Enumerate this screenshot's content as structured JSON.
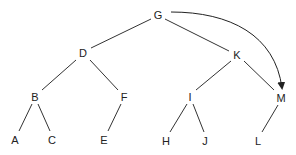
{
  "diagram": {
    "type": "tree",
    "line_color": "#333333",
    "nodes": [
      {
        "id": "G",
        "label": "G",
        "x": 158,
        "y": 15
      },
      {
        "id": "D",
        "label": "D",
        "x": 83,
        "y": 53
      },
      {
        "id": "K",
        "label": "K",
        "x": 237,
        "y": 55
      },
      {
        "id": "B",
        "label": "B",
        "x": 35,
        "y": 97
      },
      {
        "id": "F",
        "label": "F",
        "x": 124,
        "y": 97
      },
      {
        "id": "I",
        "label": "I",
        "x": 190,
        "y": 97
      },
      {
        "id": "M",
        "label": "M",
        "x": 281,
        "y": 98
      },
      {
        "id": "A",
        "label": "A",
        "x": 15,
        "y": 140
      },
      {
        "id": "C",
        "label": "C",
        "x": 52,
        "y": 140
      },
      {
        "id": "E",
        "label": "E",
        "x": 104,
        "y": 140
      },
      {
        "id": "H",
        "label": "H",
        "x": 166,
        "y": 141
      },
      {
        "id": "J",
        "label": "J",
        "x": 205,
        "y": 141
      },
      {
        "id": "L",
        "label": "L",
        "x": 258,
        "y": 141
      }
    ],
    "edges": [
      [
        "G",
        "D"
      ],
      [
        "G",
        "K"
      ],
      [
        "D",
        "B"
      ],
      [
        "D",
        "F"
      ],
      [
        "K",
        "I"
      ],
      [
        "K",
        "M"
      ],
      [
        "B",
        "A"
      ],
      [
        "B",
        "C"
      ],
      [
        "F",
        "E"
      ],
      [
        "I",
        "H"
      ],
      [
        "I",
        "J"
      ],
      [
        "M",
        "L"
      ]
    ],
    "arrows": [
      {
        "from": "G",
        "to": "M",
        "style": "curved"
      }
    ]
  }
}
